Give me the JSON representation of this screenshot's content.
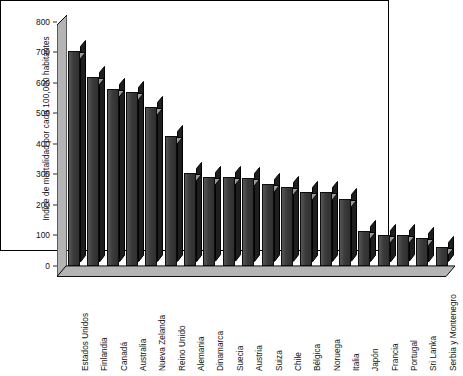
{
  "chart_data": {
    "type": "bar",
    "title": "",
    "subtitle": "",
    "xlabel": "",
    "ylabel": "Indice de mortalidad por cada 100,000 habitantes",
    "ylim": [
      0,
      800
    ],
    "yticks": [
      0,
      100,
      200,
      300,
      400,
      500,
      600,
      700,
      800
    ],
    "ytick_labels": [
      "0",
      "100",
      "200",
      "300",
      "400",
      "500",
      "600",
      "700",
      "800"
    ],
    "grid": false,
    "legend": null,
    "legend_position": "none",
    "orientation": "vertical",
    "style_3d": true,
    "categories": [
      "Estados Unidos",
      "Finlandia",
      "Canadá",
      "Australia",
      "Nueva Zelanda",
      "Reino Unido",
      "Alemania",
      "Dinamarca",
      "Suecia",
      "Austria",
      "Suiza",
      "Chile",
      "Bélgica",
      "Noruega",
      "Italia",
      "Japón",
      "Francia",
      "Portugal",
      "Sri Lanka",
      "Serbia y Montenegro"
    ],
    "values": [
      705,
      620,
      580,
      570,
      520,
      425,
      305,
      290,
      290,
      288,
      268,
      258,
      243,
      242,
      218,
      115,
      103,
      100,
      93,
      62
    ],
    "series": [
      {
        "name": "Indice de mortalidad",
        "values": [
          705,
          620,
          580,
          570,
          520,
          425,
          305,
          290,
          290,
          288,
          268,
          258,
          243,
          242,
          218,
          115,
          103,
          100,
          93,
          62
        ]
      }
    ]
  },
  "colors": {
    "bar_front": "#3b3b3b",
    "bar_side": "#1e1e1e",
    "bar_top": "#9a9a9a",
    "wall_fill": "#b4b4b4",
    "axis_line": "#000000",
    "background": "#ffffff",
    "text": "#111111"
  }
}
